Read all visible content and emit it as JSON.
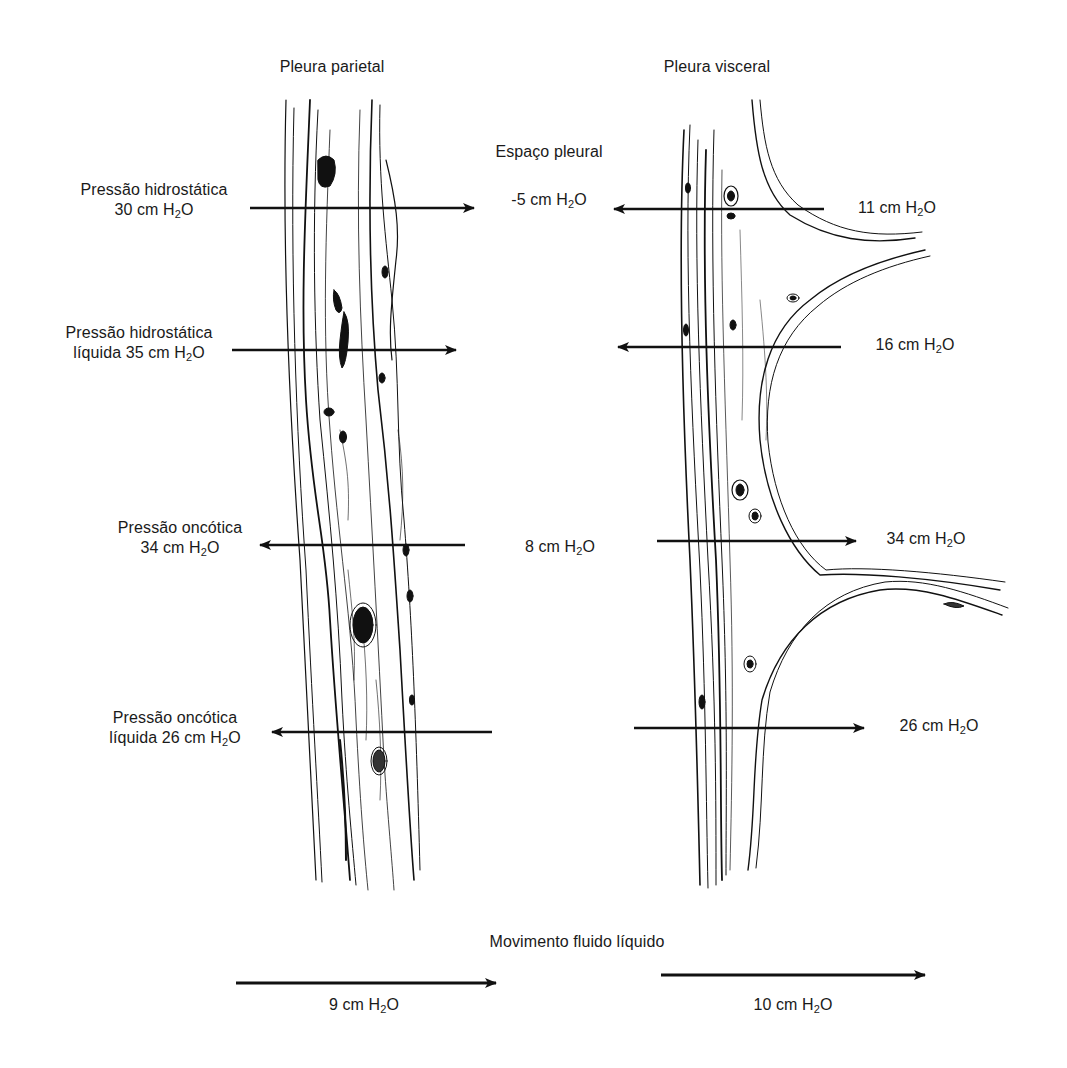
{
  "headers": {
    "parietal": "Pleura parietal",
    "visceral": "Pleura visceral",
    "space": "Espaço pleural"
  },
  "left_labels": [
    {
      "id": "hydro",
      "line1": "Pressão hidrostática",
      "value_prefix": "30 cm ",
      "h2o": {
        "h": "H",
        "sub": "2",
        "o": "O"
      },
      "arrow_direction": "right"
    },
    {
      "id": "hydro_net",
      "line1": "Pressão hidrostática",
      "value_prefix": "líquida 35 cm ",
      "h2o": {
        "h": "H",
        "sub": "2",
        "o": "O"
      },
      "arrow_direction": "right"
    },
    {
      "id": "onc",
      "line1": "Pressão oncótica",
      "value_prefix": "34 cm ",
      "h2o": {
        "h": "H",
        "sub": "2",
        "o": "O"
      },
      "arrow_direction": "left"
    },
    {
      "id": "onc_net",
      "line1": "Pressão oncótica",
      "value_prefix": "líquida 26 cm ",
      "h2o": {
        "h": "H",
        "sub": "2",
        "o": "O"
      },
      "arrow_direction": "left"
    }
  ],
  "center_labels": [
    {
      "id": "space_hydro",
      "value_prefix": "-5 cm ",
      "h": "H",
      "sub": "2",
      "o": "O"
    },
    {
      "id": "space_onc",
      "value_prefix": "8 cm ",
      "h": "H",
      "sub": "2",
      "o": "O"
    }
  ],
  "right_labels": [
    {
      "id": "v_hydro",
      "value_prefix": "11 cm ",
      "h": "H",
      "sub": "2",
      "o": "O",
      "arrow_direction": "left"
    },
    {
      "id": "v_hydro_net",
      "value_prefix": "16 cm ",
      "h": "H",
      "sub": "2",
      "o": "O",
      "arrow_direction": "left"
    },
    {
      "id": "v_onc",
      "value_prefix": "34 cm ",
      "h": "H",
      "sub": "2",
      "o": "O",
      "arrow_direction": "right"
    },
    {
      "id": "v_onc_net",
      "value_prefix": "26 cm ",
      "h": "H",
      "sub": "2",
      "o": "O",
      "arrow_direction": "right"
    }
  ],
  "net_movement": {
    "title": "Movimento fluido líquido",
    "left": {
      "value_prefix": "9 cm ",
      "h": "H",
      "sub": "2",
      "o": "O",
      "arrow_direction": "right"
    },
    "right": {
      "value_prefix": "10 cm ",
      "h": "H",
      "sub": "2",
      "o": "O",
      "arrow_direction": "right"
    }
  },
  "colors": {
    "ink": "#111111",
    "background": "#ffffff"
  }
}
